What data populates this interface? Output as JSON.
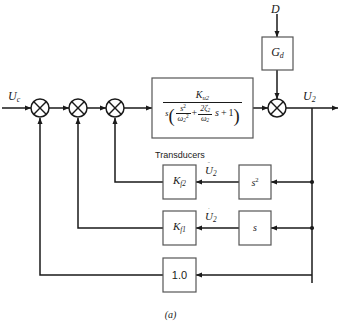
{
  "figure": {
    "caption": "(a)",
    "cropped_header": "CONTINUOUS",
    "group_label": "Transducers"
  },
  "signals": {
    "input": "U",
    "input_sub": "c",
    "output": "U",
    "output_sub": "2",
    "disturbance": "D",
    "accel_feedback": "U",
    "accel_feedback_sub": "2",
    "accel_feedback_dots": "¨",
    "rate_feedback": "U",
    "rate_feedback_sub": "2",
    "rate_feedback_dots": "˙"
  },
  "blocks": {
    "disturbance_gain": {
      "base": "G",
      "sub": "d"
    },
    "plant": {
      "numerator": {
        "base": "K",
        "sub": "u2"
      },
      "denominator": {
        "leading": "s",
        "open_paren": "(",
        "term1": {
          "num_base": "s",
          "num_sup": "2",
          "den_base": "ω",
          "den_sub": "2",
          "den_sup": "2"
        },
        "plus": "+",
        "term2": {
          "num": "2ζ",
          "num_sub": "2",
          "den": "ω",
          "den_sub": "2"
        },
        "term2_tail": "s",
        "plus2": "+",
        "one": "1",
        "close_paren": ")"
      }
    },
    "accel_transducer": {
      "base": "K",
      "sub": "f2"
    },
    "rate_transducer": {
      "base": "K",
      "sub": "f1"
    },
    "second_derivative": {
      "base": "s",
      "sup": "2"
    },
    "first_derivative": {
      "base": "s",
      "sup": ""
    },
    "unity_feedback": "1.0"
  },
  "summing_junctions": [
    {
      "name": "sum-1"
    },
    {
      "name": "sum-2"
    },
    {
      "name": "sum-3"
    },
    {
      "name": "sum-disturbance"
    }
  ],
  "colors": {
    "line": "#1a1a1a",
    "box_border": "#555555",
    "background": "#ffffff",
    "text": "#1a1a1a"
  }
}
